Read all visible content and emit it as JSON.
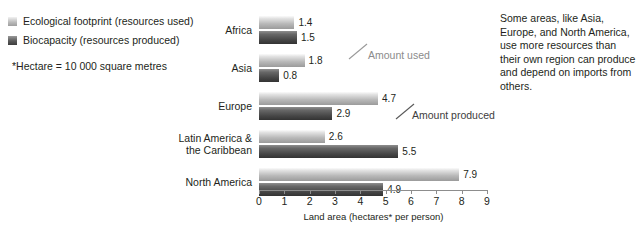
{
  "legend": {
    "items": [
      {
        "label": "Ecological footprint (resources used)",
        "swatch": "used",
        "color": "#b8b8b8"
      },
      {
        "label": "Biocapacity (resources produced)",
        "swatch": "produced",
        "color": "#454545"
      }
    ]
  },
  "footnote": "*Hectare = 10 000 square metres",
  "side_note": "Some areas, like Asia, Europe, and North America, use more resources than their own region can produce and depend on imports from others.",
  "annotations": [
    {
      "name": "amount-used",
      "text": "Amount used",
      "x": 368,
      "y": 49
    },
    {
      "name": "amount-produced",
      "text": "Amount produced",
      "x": 412,
      "y": 109
    }
  ],
  "chart_data": {
    "type": "bar",
    "orientation": "horizontal",
    "title": "",
    "xlabel": "Land area (hectares* per person)",
    "ylabel": "",
    "xlim": [
      0,
      9
    ],
    "xticks": [
      0,
      1,
      2,
      3,
      4,
      5,
      6,
      7,
      8,
      9
    ],
    "xtick_labels": [
      "0",
      "1",
      "2",
      "3",
      "4",
      "5",
      "6",
      "7",
      "8",
      "9"
    ],
    "grid": false,
    "legend_position": "top-left",
    "categories": [
      "Africa",
      "Asia",
      "Europe",
      "Latin America &\nthe Caribbean",
      "North America"
    ],
    "category_lines": [
      [
        "Africa"
      ],
      [
        "Asia"
      ],
      [
        "Europe"
      ],
      [
        "Latin America &",
        "the Caribbean"
      ],
      [
        "North America"
      ]
    ],
    "series": [
      {
        "name": "Ecological footprint (resources used)",
        "short_name": "Amount used",
        "color": "#b8b8b8",
        "values": [
          1.4,
          1.8,
          4.7,
          2.6,
          7.9
        ],
        "value_labels": [
          "1.4",
          "1.8",
          "4.7",
          "2.6",
          "7.9"
        ]
      },
      {
        "name": "Biocapacity (resources produced)",
        "short_name": "Amount produced",
        "color": "#454545",
        "values": [
          1.5,
          0.8,
          2.9,
          5.5,
          4.9
        ],
        "value_labels": [
          "1.5",
          "0.8",
          "2.9",
          "5.5",
          "4.9"
        ]
      }
    ]
  }
}
